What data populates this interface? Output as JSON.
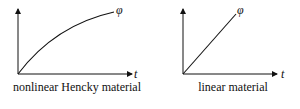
{
  "panels": [
    {
      "caption": "nonlinear Hencky material",
      "x_axis_label": "t",
      "curve_label": "φ",
      "curve_type": "concave"
    },
    {
      "caption": "linear material",
      "x_axis_label": "t",
      "curve_label": "φ",
      "curve_type": "linear"
    }
  ]
}
